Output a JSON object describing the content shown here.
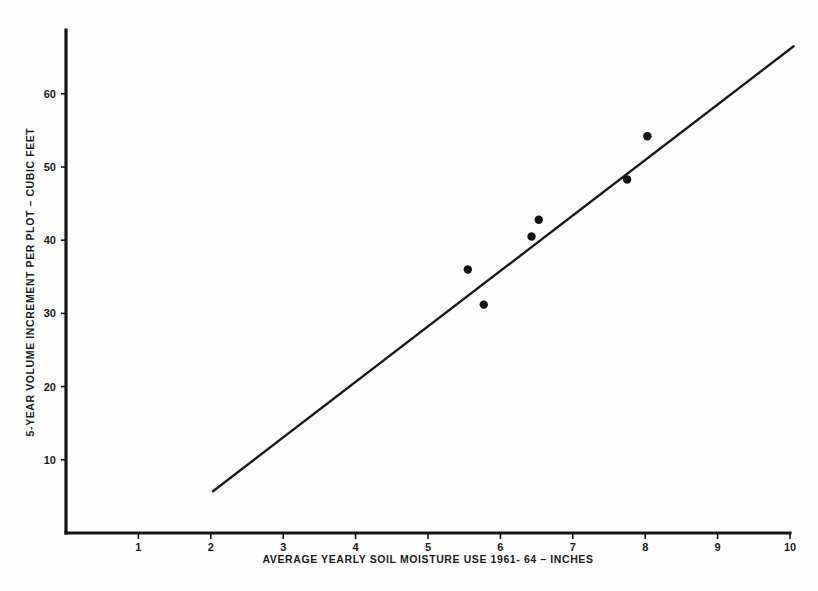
{
  "chart_data": {
    "type": "scatter",
    "title": "",
    "subtitle": "",
    "xlabel": "AVERAGE YEARLY SOIL MOISTURE USE 1961- 64 – INCHES",
    "ylabel": "5-YEAR VOLUME INCREMENT PER PLOT – CUBIC FEET",
    "xlim": [
      0,
      10.1
    ],
    "ylim": [
      0,
      68.5
    ],
    "grid": false,
    "legend": "none",
    "x_ticks": [
      1,
      2,
      3,
      4,
      5,
      6,
      7,
      8,
      9,
      10
    ],
    "x_tick_labels": [
      "1",
      "2",
      "3",
      "4",
      "5",
      "6",
      "7",
      "8",
      "9",
      "10"
    ],
    "y_ticks": [
      10,
      20,
      30,
      40,
      50,
      60
    ],
    "y_tick_labels": [
      "10",
      "20",
      "30",
      "40",
      "50",
      "60"
    ],
    "points": [
      {
        "x": 5.55,
        "y": 36.0
      },
      {
        "x": 5.77,
        "y": 31.2
      },
      {
        "x": 6.43,
        "y": 40.5
      },
      {
        "x": 6.53,
        "y": 42.8
      },
      {
        "x": 7.75,
        "y": 48.3
      },
      {
        "x": 8.03,
        "y": 54.2
      }
    ],
    "series": [
      {
        "name": "5-year volume increment per plot",
        "type": "scatter",
        "x": [
          5.55,
          5.77,
          6.43,
          6.53,
          7.75,
          8.03
        ],
        "values": [
          36.0,
          31.2,
          40.5,
          42.8,
          48.3,
          54.2
        ]
      },
      {
        "name": "fitted regression line",
        "type": "line",
        "x": [
          2.03,
          10.05
        ],
        "values": [
          5.7,
          66.5
        ]
      }
    ],
    "fit_line": {
      "x_start": 2.03,
      "y_start": 5.7,
      "x_end": 10.05,
      "y_end": 66.5,
      "slope": 7.58,
      "intercept": -9.69
    },
    "annotations": []
  },
  "axes": {
    "x_axis_name": "x-axis",
    "y_axis_name": "y-axis"
  }
}
